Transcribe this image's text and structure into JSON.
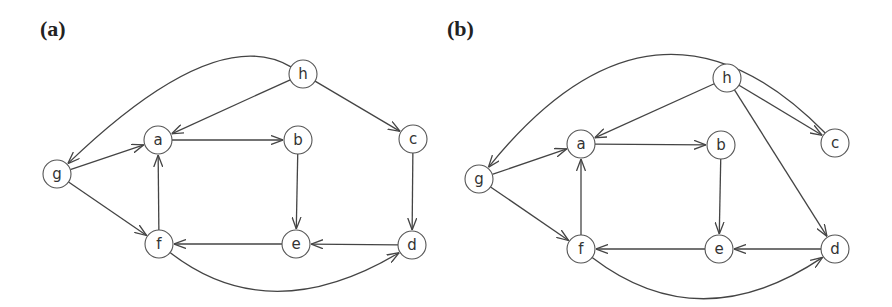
{
  "panels": [
    {
      "label": "(a)",
      "label_pos": [
        40,
        18
      ],
      "nodes": [
        {
          "id": "h",
          "label": "h",
          "x": 303,
          "y": 74
        },
        {
          "id": "a",
          "label": "a",
          "x": 158,
          "y": 140
        },
        {
          "id": "b",
          "label": "b",
          "x": 298,
          "y": 140
        },
        {
          "id": "c",
          "label": "c",
          "x": 413,
          "y": 139
        },
        {
          "id": "g",
          "label": "g",
          "x": 57,
          "y": 174
        },
        {
          "id": "f",
          "label": "f",
          "x": 159,
          "y": 244
        },
        {
          "id": "e",
          "label": "e",
          "x": 296,
          "y": 244
        },
        {
          "id": "d",
          "label": "d",
          "x": 412,
          "y": 245
        }
      ],
      "edges": [
        {
          "from": "h",
          "to": "g",
          "curve": [
            215,
            22
          ]
        },
        {
          "from": "h",
          "to": "a"
        },
        {
          "from": "h",
          "to": "c"
        },
        {
          "from": "g",
          "to": "a"
        },
        {
          "from": "g",
          "to": "f"
        },
        {
          "from": "a",
          "to": "b"
        },
        {
          "from": "b",
          "to": "e"
        },
        {
          "from": "c",
          "to": "d"
        },
        {
          "from": "f",
          "to": "a"
        },
        {
          "from": "e",
          "to": "f"
        },
        {
          "from": "d",
          "to": "e"
        },
        {
          "from": "f",
          "to": "d",
          "curve": [
            270,
            330
          ]
        }
      ]
    },
    {
      "label": "(b)",
      "label_pos": [
        447,
        18
      ],
      "nodes": [
        {
          "id": "h",
          "label": "h",
          "x": 727,
          "y": 78
        },
        {
          "id": "a",
          "label": "a",
          "x": 581,
          "y": 144
        },
        {
          "id": "b",
          "label": "b",
          "x": 721,
          "y": 145
        },
        {
          "id": "c",
          "label": "c",
          "x": 835,
          "y": 143
        },
        {
          "id": "g",
          "label": "g",
          "x": 479,
          "y": 179
        },
        {
          "id": "f",
          "label": "f",
          "x": 581,
          "y": 249
        },
        {
          "id": "e",
          "label": "e",
          "x": 719,
          "y": 249
        },
        {
          "id": "d",
          "label": "d",
          "x": 835,
          "y": 249
        }
      ],
      "edges": [
        {
          "from": "c",
          "to": "g",
          "curve": [
            655,
            -40
          ]
        },
        {
          "from": "h",
          "to": "a"
        },
        {
          "from": "h",
          "to": "c"
        },
        {
          "from": "h",
          "to": "d"
        },
        {
          "from": "g",
          "to": "a"
        },
        {
          "from": "g",
          "to": "f"
        },
        {
          "from": "a",
          "to": "b"
        },
        {
          "from": "b",
          "to": "e"
        },
        {
          "from": "f",
          "to": "a"
        },
        {
          "from": "e",
          "to": "f"
        },
        {
          "from": "d",
          "to": "e"
        },
        {
          "from": "f",
          "to": "d",
          "curve": [
            700,
            340
          ]
        }
      ]
    }
  ],
  "style": {
    "node_radius": 14,
    "edge_color": "#444444",
    "node_stroke": "#555555"
  }
}
